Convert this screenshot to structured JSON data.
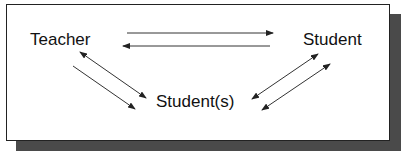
{
  "diagram": {
    "type": "interaction-diagram",
    "nodes": [
      {
        "id": "teacher",
        "label": "Teacher"
      },
      {
        "id": "student",
        "label": "Student"
      },
      {
        "id": "students",
        "label": "Student(s)"
      }
    ],
    "edges": [
      {
        "from": "teacher",
        "to": "student",
        "style": "single-arrow"
      },
      {
        "from": "student",
        "to": "teacher",
        "style": "single-arrow"
      },
      {
        "from": "teacher",
        "to": "students",
        "style": "double-arrow"
      },
      {
        "from": "teacher",
        "to": "students",
        "style": "single-arrow"
      },
      {
        "from": "student",
        "to": "students",
        "style": "double-arrow"
      },
      {
        "from": "students",
        "to": "student",
        "style": "double-arrow"
      }
    ],
    "colors": {
      "box_border": "#222222",
      "shadow": "#4a4a4a",
      "line": "#333333",
      "text": "#111111"
    }
  }
}
